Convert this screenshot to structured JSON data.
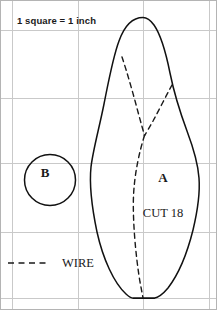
{
  "page": {
    "background_color": "#ffffff",
    "width": 217,
    "height": 310
  },
  "grid": {
    "note": "1 square = 1 inch",
    "line_color": "#c9c9c9",
    "border_color": "#b4b4b4",
    "vertical_lines_x": [
      12,
      78,
      143,
      210
    ],
    "horizontal_lines_y": [
      30,
      98,
      163,
      232,
      298
    ],
    "square_size_px": 66,
    "square_unit": "1 inch"
  },
  "legend": {
    "wire_label": "WIRE",
    "wire_line_style": "dashed",
    "wire_line_color": "#1a1a1a"
  },
  "pieces": [
    {
      "id": "piece-a",
      "label": "A",
      "note": "CUT 18",
      "shape": "leaf",
      "outline_color": "#111111",
      "fill": "none"
    },
    {
      "id": "piece-b",
      "label": "B",
      "shape": "circle",
      "outline_color": "#111111",
      "fill": "none",
      "center_x": 50,
      "center_y": 180,
      "radius": 25.5
    }
  ],
  "wire_guides": [
    {
      "id": "wire-left-vein",
      "style": "dashed"
    },
    {
      "id": "wire-right-vein",
      "style": "dashed"
    },
    {
      "id": "wire-center-vein",
      "style": "dashed"
    }
  ]
}
